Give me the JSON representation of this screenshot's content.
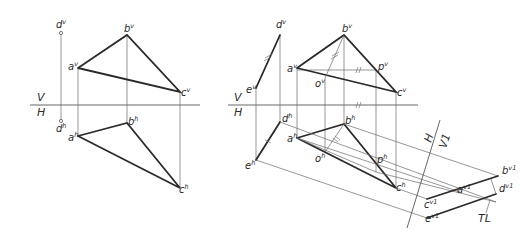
{
  "figure": {
    "type": "descriptive-geometry-auxiliary-view",
    "left_view": {
      "fold_line": {
        "upper": "V",
        "lower": "H"
      },
      "labels": {
        "dv": "d",
        "dv_sup": "v",
        "bv": "b",
        "bv_sup": "v",
        "av": "a",
        "av_sup": "v",
        "cv": "c",
        "cv_sup": "v",
        "dh": "d",
        "dh_sup": "h",
        "bh": "b",
        "bh_sup": "h",
        "ah": "a",
        "ah_sup": "h",
        "ch": "c",
        "ch_sup": "h"
      }
    },
    "right_view": {
      "fold_line": {
        "upper": "V",
        "lower": "H"
      },
      "aux_fold_line": {
        "left": "H",
        "right": "V1"
      },
      "true_length_label": "TL",
      "labels": {
        "dv": "d",
        "dv_sup": "v",
        "ev": "e",
        "ev_sup": "v",
        "bv": "b",
        "bv_sup": "v",
        "av": "a",
        "av_sup": "v",
        "ov": "o",
        "ov_sup": "v",
        "pv": "p",
        "pv_sup": "v",
        "cv": "c",
        "cv_sup": "v",
        "dh": "d",
        "dh_sup": "h",
        "eh": "e",
        "eh_sup": "h",
        "bh": "b",
        "bh_sup": "h",
        "ah": "a",
        "ah_sup": "h",
        "oh": "o",
        "oh_sup": "h",
        "ph": "p",
        "ph_sup": "h",
        "ch": "c",
        "ch_sup": "h",
        "bv1": "b",
        "bv1_sup": "v1",
        "av1": "a",
        "av1_sup": "v1",
        "dv1": "d",
        "dv1_sup": "v1",
        "cv1": "c",
        "cv1_sup": "v1",
        "ev1": "e",
        "ev1_sup": "v1"
      }
    }
  }
}
